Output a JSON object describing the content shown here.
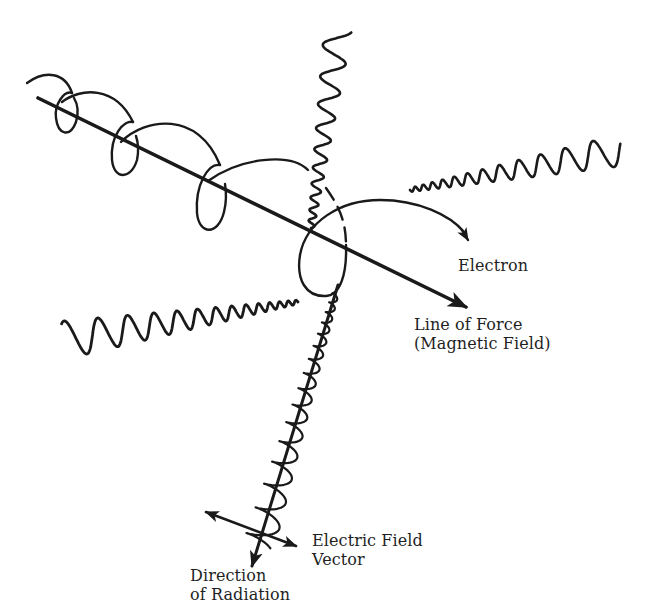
{
  "diagram": {
    "colors": {
      "ink": "#1a1a1a",
      "background": "#ffffff"
    },
    "labels": {
      "electron": "Electron",
      "line_of_force": [
        "Line of Force",
        "(Magnetic Field)"
      ],
      "electric_field": [
        "Electric Field",
        "Vector"
      ],
      "direction": [
        "Direction",
        "of Radiation"
      ]
    },
    "elements": [
      {
        "id": "magnetic-field-line",
        "kind": "arrow",
        "from": [
          38,
          98
        ],
        "to": [
          472,
          310
        ]
      },
      {
        "id": "electron-path",
        "kind": "helix",
        "loops": 4,
        "arrow_end": [
          468,
          240
        ]
      },
      {
        "id": "wave-up",
        "kind": "chirped-wave",
        "direction": "up"
      },
      {
        "id": "wave-right",
        "kind": "chirped-wave",
        "direction": "upper-right"
      },
      {
        "id": "wave-left",
        "kind": "chirped-wave",
        "direction": "left"
      },
      {
        "id": "wave-down",
        "kind": "chirped-wave",
        "direction": "down-left"
      },
      {
        "id": "direction-of-radiation-arrow",
        "kind": "arrow",
        "from": [
          338,
          285
        ],
        "to": [
          250,
          568
        ]
      },
      {
        "id": "electric-field-vector",
        "kind": "double-arrow",
        "from": [
          204,
          512
        ],
        "to": [
          298,
          547
        ]
      }
    ]
  }
}
